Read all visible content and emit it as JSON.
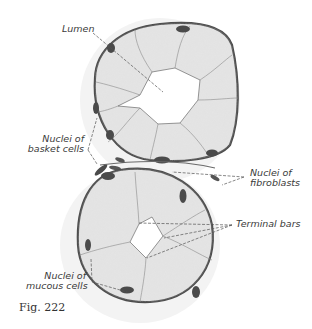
{
  "figure": {
    "caption": "Fig. 222",
    "labels": {
      "lumen": "Lumen",
      "basket_nuclei_line1": "Nuclei of",
      "basket_nuclei_line2": "basket cells",
      "fibroblast_nuclei_line1": "Nuclei of",
      "fibroblast_nuclei_line2": "fibroblasts",
      "terminal_bars": "Terminal bars",
      "mucous_nuclei_line1": "Nuclei of",
      "mucous_nuclei_line2": "mucous cells"
    },
    "colors": {
      "cytoplasm": "#e4e4e4",
      "membrane": "#555555",
      "nucleus": "#4a4a4a",
      "connective": "#f2f2f2"
    }
  }
}
